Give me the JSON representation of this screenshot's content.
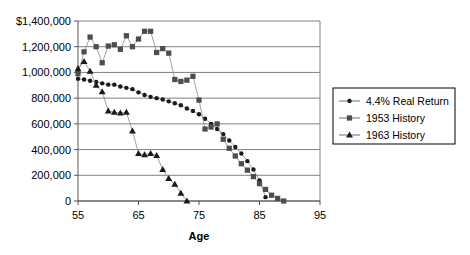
{
  "chart_data": {
    "type": "scatter",
    "title": "",
    "xlabel": "Age",
    "ylabel": "",
    "xlim": [
      55,
      95
    ],
    "ylim": [
      0,
      1400000
    ],
    "grid": true,
    "legend_position": "right",
    "xticks": [
      "55",
      "65",
      "75",
      "85",
      "95"
    ],
    "xtick_values": [
      55,
      65,
      75,
      85,
      95
    ],
    "yticks": [
      "0",
      "200,000",
      "400,000",
      "600,000",
      "800,000",
      "1,000,000",
      "1,200,000",
      "$1,400,000"
    ],
    "ytick_values": [
      0,
      200000,
      400000,
      600000,
      800000,
      1000000,
      1200000,
      1400000
    ],
    "series": [
      {
        "name": "4.4% Real Return",
        "marker": "circle",
        "color": "#1a1a1a",
        "x": [
          55,
          56,
          57,
          58,
          59,
          60,
          61,
          62,
          63,
          64,
          65,
          66,
          67,
          68,
          69,
          70,
          71,
          72,
          73,
          74,
          75,
          76,
          77,
          78,
          79,
          80,
          81,
          82,
          83,
          84,
          85,
          86
        ],
        "values": [
          950000,
          945000,
          935000,
          925000,
          915000,
          905000,
          905000,
          890000,
          880000,
          870000,
          845000,
          825000,
          810000,
          800000,
          790000,
          775000,
          760000,
          745000,
          720000,
          700000,
          675000,
          640000,
          600000,
          560000,
          520000,
          470000,
          420000,
          370000,
          310000,
          245000,
          160000,
          30000
        ]
      },
      {
        "name": "1953 History",
        "marker": "square",
        "color": "#4d4d4d",
        "x": [
          55,
          56,
          57,
          58,
          59,
          60,
          61,
          62,
          63,
          64,
          65,
          66,
          67,
          68,
          69,
          70,
          71,
          72,
          73,
          74,
          75,
          76,
          77,
          78,
          79,
          80,
          81,
          82,
          83,
          84,
          85,
          86,
          87,
          88,
          89
        ],
        "values": [
          990000,
          1160000,
          1275000,
          1200000,
          1075000,
          1205000,
          1215000,
          1180000,
          1285000,
          1200000,
          1260000,
          1320000,
          1320000,
          1155000,
          1185000,
          1150000,
          945000,
          930000,
          940000,
          970000,
          785000,
          560000,
          575000,
          600000,
          480000,
          410000,
          350000,
          290000,
          240000,
          190000,
          135000,
          90000,
          45000,
          20000,
          0
        ]
      },
      {
        "name": "1963 History",
        "marker": "triangle",
        "color": "#1a1a1a",
        "x": [
          55,
          56,
          57,
          58,
          59,
          60,
          61,
          62,
          63,
          64,
          65,
          66,
          67,
          68,
          69,
          70,
          71,
          72,
          73
        ],
        "values": [
          1030000,
          1085000,
          1010000,
          900000,
          850000,
          700000,
          690000,
          685000,
          690000,
          545000,
          370000,
          360000,
          370000,
          355000,
          245000,
          175000,
          130000,
          60000,
          0
        ]
      }
    ]
  },
  "legend": {
    "items": [
      {
        "label": "4.4% Real Return",
        "marker": "circle"
      },
      {
        "label": "1953 History",
        "marker": "square"
      },
      {
        "label": "1963 History",
        "marker": "triangle"
      }
    ]
  },
  "axis": {
    "x_title": "Age"
  }
}
